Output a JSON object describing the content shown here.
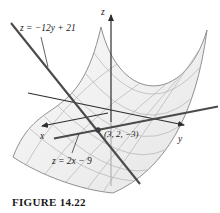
{
  "figure": {
    "caption": "FIGURE 14.22",
    "labels": {
      "tangent_line_y": "z = −12y + 21",
      "tangent_line_x": "z = 2x − 9",
      "tangent_point": "(3, 2, −3)",
      "axis_x": "x",
      "axis_y": "y",
      "axis_z": "z"
    },
    "colors": {
      "tangent_line": "#4a4a4a",
      "axis_line": "#2e2e2e",
      "mesh_line": "#b3b3b3",
      "surface_edge": "#909090",
      "surface_fill_light": "#f6f6f6",
      "surface_fill_dark": "#e2e2e2",
      "text": "#1a1a1a"
    }
  }
}
